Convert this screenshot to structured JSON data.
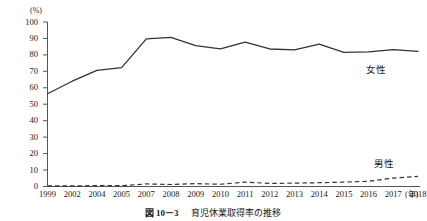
{
  "figure": {
    "caption_number": "図 10－3",
    "caption_title": "育児休業取得率の推移",
    "caption_full": "図 10－3　育児休業取得率の推移"
  },
  "axes": {
    "y_unit": "(%)",
    "x_unit": "(年)"
  },
  "labels": {
    "female": "女性",
    "male": "男性"
  },
  "chart_data": {
    "type": "line",
    "title": "育児休業取得率の推移",
    "xlabel": "(年)",
    "ylabel": "(%)",
    "ylim": [
      0,
      100
    ],
    "yticks": [
      0,
      10,
      20,
      30,
      40,
      50,
      60,
      70,
      80,
      90,
      100
    ],
    "ytick_labels": [
      "0",
      "10",
      "20",
      "30",
      "40",
      "50",
      "60",
      "70",
      "80",
      "90",
      "100"
    ],
    "grid": false,
    "legend_position": "inline-right",
    "categories": [
      "1999",
      "2002",
      "2004",
      "2005",
      "2007",
      "2008",
      "2009",
      "2010",
      "2011",
      "2012",
      "2013",
      "2014",
      "2015",
      "2016",
      "2017",
      "2018"
    ],
    "series": [
      {
        "name": "女性",
        "style": "solid",
        "color": "#333333",
        "values": [
          56.4,
          64.0,
          70.6,
          72.3,
          89.7,
          90.6,
          85.6,
          83.7,
          87.8,
          83.6,
          83.0,
          86.6,
          81.5,
          81.8,
          83.2,
          82.2
        ]
      },
      {
        "name": "男性",
        "style": "dashed",
        "color": "#333333",
        "values": [
          0.42,
          0.33,
          0.56,
          0.5,
          1.56,
          1.23,
          1.72,
          1.38,
          2.63,
          1.89,
          2.03,
          2.3,
          2.65,
          3.16,
          5.14,
          6.16
        ]
      }
    ]
  }
}
